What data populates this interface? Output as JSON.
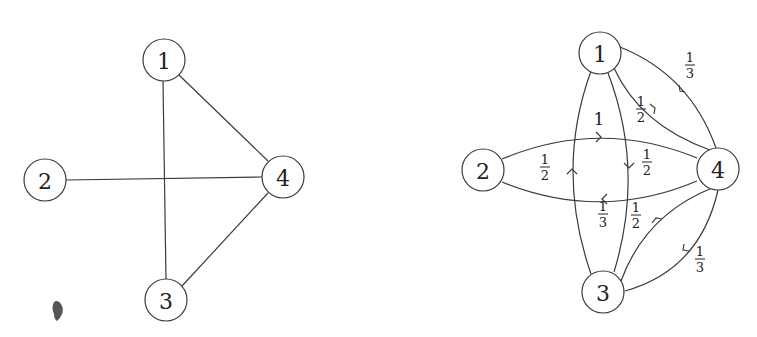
{
  "left_graph": {
    "title": "Undirected graph",
    "nodes": [
      {
        "id": "1",
        "label": "1",
        "x": 164,
        "y": 60
      },
      {
        "id": "2",
        "label": "2",
        "x": 45,
        "y": 180
      },
      {
        "id": "3",
        "label": "3",
        "x": 166,
        "y": 300
      },
      {
        "id": "4",
        "label": "4",
        "x": 283,
        "y": 177
      }
    ],
    "edges": [
      {
        "from": "1",
        "to": "3"
      },
      {
        "from": "1",
        "to": "4"
      },
      {
        "from": "2",
        "to": "4"
      },
      {
        "from": "3",
        "to": "4"
      }
    ]
  },
  "right_graph": {
    "title": "Weighted directed graph (transition probabilities)",
    "nodes": [
      {
        "id": "1",
        "label": "1",
        "x": 600,
        "y": 53
      },
      {
        "id": "2",
        "label": "2",
        "x": 483,
        "y": 170
      },
      {
        "id": "3",
        "label": "3",
        "x": 603,
        "y": 292
      },
      {
        "id": "4",
        "label": "4",
        "x": 718,
        "y": 169
      }
    ],
    "edges": [
      {
        "from": "2",
        "to": "4",
        "weight": "1",
        "num": "1",
        "den": ""
      },
      {
        "from": "4",
        "to": "2",
        "weight": "1/3",
        "num": "1",
        "den": "3"
      },
      {
        "from": "1",
        "to": "3",
        "weight": "1/2",
        "num": "1",
        "den": "2"
      },
      {
        "from": "3",
        "to": "1",
        "weight": "1/2",
        "num": "1",
        "den": "2"
      },
      {
        "from": "1",
        "to": "4",
        "weight": "1/2",
        "num": "1",
        "den": "2"
      },
      {
        "from": "4",
        "to": "1",
        "weight": "1/3",
        "num": "1",
        "den": "3"
      },
      {
        "from": "3",
        "to": "4",
        "weight": "1/2",
        "num": "1",
        "den": "2"
      },
      {
        "from": "4",
        "to": "3",
        "weight": "1/3",
        "num": "1",
        "den": "3"
      }
    ]
  },
  "labels": {
    "n1": "1",
    "n2": "2",
    "n3": "3",
    "n4": "4",
    "w_2_4": "1",
    "w_4_2_num": "1",
    "w_4_2_den": "3",
    "w_1_3_num": "1",
    "w_1_3_den": "2",
    "w_3_1_num": "1",
    "w_3_1_den": "2",
    "w_1_4_num": "1",
    "w_1_4_den": "2",
    "w_4_1_num": "1",
    "w_4_1_den": "3",
    "w_3_4_num": "1",
    "w_3_4_den": "2",
    "w_4_3_num": "1",
    "w_4_3_den": "3"
  }
}
